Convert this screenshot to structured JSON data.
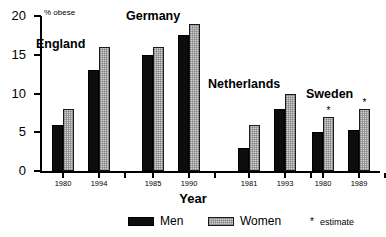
{
  "chart_data": {
    "type": "bar",
    "title": "",
    "xlabel": "Year",
    "ylabel": "% obese",
    "ylim": [
      0,
      20
    ],
    "yticks": [
      0,
      5,
      10,
      15,
      20
    ],
    "grid": false,
    "legend_position": "bottom",
    "legend": [
      {
        "name": "Men",
        "color": "#0d0d0d"
      },
      {
        "name": "Women",
        "color": "#d2d2d2"
      }
    ],
    "annotations": [
      {
        "symbol": "*",
        "text": "estimate"
      }
    ],
    "series": [
      {
        "name": "Men",
        "values": [
          6,
          13,
          15,
          17.5,
          3,
          8,
          5,
          5.3
        ]
      },
      {
        "name": "Women",
        "values": [
          8,
          16,
          16,
          19,
          6,
          10,
          7,
          8
        ]
      }
    ],
    "categories": [
      "1980",
      "1994",
      "1985",
      "1990",
      "1981",
      "1993",
      "1980",
      "1989"
    ],
    "groups": [
      {
        "country": "England",
        "bars": [
          {
            "year": "1980",
            "men": 6,
            "women": 8,
            "men_estimate": false,
            "women_estimate": false
          },
          {
            "year": "1994",
            "men": 13,
            "women": 16,
            "men_estimate": false,
            "women_estimate": false
          }
        ]
      },
      {
        "country": "Germany",
        "bars": [
          {
            "year": "1985",
            "men": 15,
            "women": 16,
            "men_estimate": false,
            "women_estimate": false
          },
          {
            "year": "1990",
            "men": 17.5,
            "women": 19,
            "men_estimate": false,
            "women_estimate": false
          }
        ]
      },
      {
        "country": "Netherlands",
        "bars": [
          {
            "year": "1981",
            "men": 3,
            "women": 6,
            "men_estimate": false,
            "women_estimate": false
          },
          {
            "year": "1993",
            "men": 8,
            "women": 10,
            "men_estimate": false,
            "women_estimate": false
          }
        ]
      },
      {
        "country": "Sweden",
        "bars": [
          {
            "year": "1980",
            "men": 5,
            "women": 7,
            "men_estimate": false,
            "women_estimate": true
          },
          {
            "year": "1989",
            "men": 5.3,
            "women": 8,
            "men_estimate": false,
            "women_estimate": true
          }
        ]
      }
    ]
  },
  "layout": {
    "group_x": [
      52,
      142,
      238,
      312
    ],
    "country_title_x": [
      36,
      126,
      208,
      306
    ],
    "country_title_y": [
      38,
      10,
      78,
      88
    ],
    "pair_gap": 36,
    "bar_width": 11,
    "axis_top": 16,
    "axis_bottom": 171,
    "estimate_symbol": "*"
  }
}
